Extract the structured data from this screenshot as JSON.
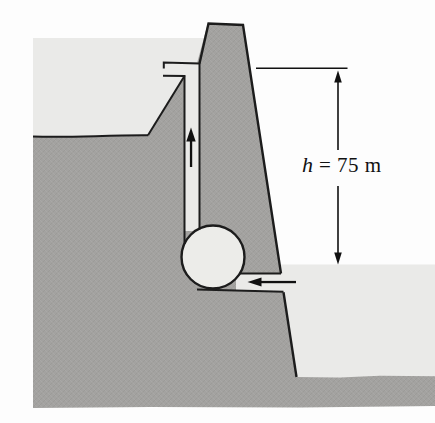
{
  "figure": {
    "kind": "physics-cross-section-diagram",
    "annotation": {
      "height_symbol": "h",
      "height_value": "= 75 m",
      "full_label": "h = 75 m"
    },
    "colors": {
      "background": "#fdfdfd",
      "ground": "#a3a2a0",
      "ground_strip": "#a7a6a3",
      "water": "#eaeae8",
      "pipe_water": "#eaeae8",
      "pump": "#ecece9",
      "outline": "#1c1c1c",
      "arrow": "#111111"
    }
  }
}
